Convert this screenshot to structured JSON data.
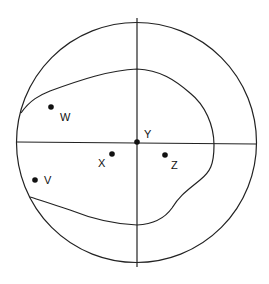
{
  "diagram": {
    "type": "circle-with-axes-and-region",
    "points": [
      {
        "id": "W",
        "label": "W"
      },
      {
        "id": "Y",
        "label": "Y"
      },
      {
        "id": "X",
        "label": "X"
      },
      {
        "id": "Z",
        "label": "Z"
      },
      {
        "id": "V",
        "label": "V"
      }
    ],
    "colors": {
      "stroke": "#222222",
      "background": "#ffffff"
    }
  }
}
